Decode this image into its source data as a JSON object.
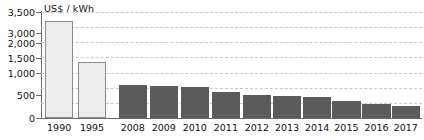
{
  "chart_data": {
    "type": "bar",
    "title": "",
    "subtitle": "",
    "xlabel": "",
    "ylabel": "US$ / kWh",
    "ylim": [
      0,
      3500
    ],
    "grid": true,
    "legend_position": "none",
    "axis_note": "y-axis tick labels are irregular: 2,500 is not shown and 3,000 / 2,000 labels appear compressed",
    "y_ticks": [
      {
        "label": "3,500",
        "value": 3500
      },
      {
        "label": "3,000",
        "value": 3000
      },
      {
        "label": "2,000",
        "value": 2000
      },
      {
        "label": "1,500",
        "value": 1500
      },
      {
        "label": "1,000",
        "value": 1000
      },
      {
        "label": "500",
        "value": 500
      },
      {
        "label": "0",
        "value": 0
      }
    ],
    "gridlines": [
      3500,
      3000,
      2500,
      2000,
      1500,
      1000,
      500
    ],
    "categories": [
      "1990",
      "1995",
      "2008",
      "2009",
      "2010",
      "2011",
      "2012",
      "2013",
      "2014",
      "2015",
      "2016",
      "2017"
    ],
    "values": [
      3200,
      1850,
      1100,
      1050,
      1020,
      870,
      760,
      740,
      700,
      560,
      460,
      400
    ],
    "series": [
      {
        "name": "Historical",
        "color": "#ececec",
        "points": [
          {
            "category": "1990",
            "value": 3200
          },
          {
            "category": "1995",
            "value": 1850
          }
        ]
      },
      {
        "name": "Recent",
        "color": "#5b5b5b",
        "points": [
          {
            "category": "2008",
            "value": 1100
          },
          {
            "category": "2009",
            "value": 1050
          },
          {
            "category": "2010",
            "value": 1020
          },
          {
            "category": "2011",
            "value": 870
          },
          {
            "category": "2012",
            "value": 760
          },
          {
            "category": "2013",
            "value": 740
          },
          {
            "category": "2014",
            "value": 700
          },
          {
            "category": "2015",
            "value": 560
          },
          {
            "category": "2016",
            "value": 460
          },
          {
            "category": "2017",
            "value": 400
          }
        ]
      }
    ],
    "colors": {
      "light_bar_fill": "#ececec",
      "light_bar_stroke": "#8c8c8c",
      "dark_bar_fill": "#5b5b5b",
      "axis": "#6a6a6a",
      "grid": "#c9c9c9",
      "text": "#111111",
      "background": "#ffffff"
    }
  }
}
